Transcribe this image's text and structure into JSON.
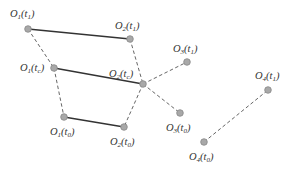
{
  "diagram": {
    "type": "object-trajectory-diagram",
    "colors": {
      "solid_edge": "#333333",
      "dashed_edge": "#666666",
      "node_fill": "#a8a8a8",
      "label": "#333333"
    },
    "nodes": [
      {
        "id": "O1_t1",
        "obj": "1",
        "time": "1",
        "x": 28,
        "y": 29,
        "label": {
          "O": "O",
          "objsub": "1",
          "open": "(t",
          "tsub": "1",
          "close": ")"
        },
        "lx": 10,
        "ly": 17
      },
      {
        "id": "O2_t1",
        "obj": "2",
        "time": "1",
        "x": 130,
        "y": 39,
        "label": {
          "O": "O",
          "objsub": "2",
          "open": "(t",
          "tsub": "1",
          "close": ")"
        },
        "lx": 115,
        "ly": 29
      },
      {
        "id": "O1_tc",
        "obj": "1",
        "time": "c",
        "x": 54,
        "y": 68,
        "label": {
          "O": "O",
          "objsub": "1",
          "open": "(t",
          "tsub": "c",
          "close": ")"
        },
        "lx": 20,
        "ly": 71
      },
      {
        "id": "O2_tc",
        "obj": "2",
        "time": "c",
        "x": 143,
        "y": 84,
        "label": {
          "O": "O",
          "objsub": "2",
          "open": "(t",
          "tsub": "c",
          "close": ")"
        },
        "lx": 109,
        "ly": 77
      },
      {
        "id": "O1_t0",
        "obj": "1",
        "time": "0",
        "x": 64,
        "y": 117,
        "label": {
          "O": "O",
          "objsub": "1",
          "open": "(t",
          "tsub": "0",
          "close": ")"
        },
        "lx": 50,
        "ly": 135
      },
      {
        "id": "O2_t0",
        "obj": "2",
        "time": "0",
        "x": 124,
        "y": 127,
        "label": {
          "O": "O",
          "objsub": "2",
          "open": "(t",
          "tsub": "0",
          "close": ")"
        },
        "lx": 110,
        "ly": 145
      },
      {
        "id": "O3_t1",
        "obj": "3",
        "time": "1",
        "x": 187,
        "y": 62,
        "label": {
          "O": "O",
          "objsub": "3",
          "open": "(t",
          "tsub": "1",
          "close": ")"
        },
        "lx": 173,
        "ly": 52
      },
      {
        "id": "O3_t0",
        "obj": "3",
        "time": "0",
        "x": 180,
        "y": 113,
        "label": {
          "O": "O",
          "objsub": "3",
          "open": "(t",
          "tsub": "0",
          "close": ")"
        },
        "lx": 166,
        "ly": 131
      },
      {
        "id": "O4_t1",
        "obj": "4",
        "time": "1",
        "x": 268,
        "y": 90,
        "label": {
          "O": "O",
          "objsub": "4",
          "open": "(t",
          "tsub": "1",
          "close": ")"
        },
        "lx": 255,
        "ly": 79
      },
      {
        "id": "O4_t0",
        "obj": "4",
        "time": "0",
        "x": 204,
        "y": 142,
        "label": {
          "O": "O",
          "objsub": "4",
          "open": "(t",
          "tsub": "0",
          "close": ")"
        },
        "lx": 189,
        "ly": 160
      }
    ],
    "edges": [
      {
        "from": "O1_t1",
        "to": "O2_t1",
        "style": "solid"
      },
      {
        "from": "O1_tc",
        "to": "O2_tc",
        "style": "solid"
      },
      {
        "from": "O1_t0",
        "to": "O2_t0",
        "style": "solid"
      },
      {
        "from": "O1_t1",
        "to": "O1_tc",
        "style": "dashed"
      },
      {
        "from": "O1_tc",
        "to": "O1_t0",
        "style": "dashed"
      },
      {
        "from": "O2_t1",
        "to": "O2_tc",
        "style": "dashed"
      },
      {
        "from": "O2_tc",
        "to": "O2_t0",
        "style": "dashed"
      },
      {
        "from": "O2_tc",
        "to": "O3_t1",
        "style": "dashed"
      },
      {
        "from": "O2_tc",
        "to": "O3_t0",
        "style": "dashed"
      },
      {
        "from": "O4_t0",
        "to": "O4_t1",
        "style": "dashed"
      }
    ]
  }
}
